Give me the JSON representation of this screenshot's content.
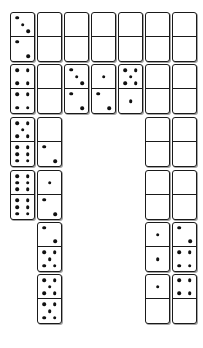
{
  "scene": {
    "title": "Domino Board",
    "background_color": "#ffffff",
    "tile_color": "#ffffff",
    "tile_border_color": "#1a1a1a",
    "pip_color": "#111111",
    "grid": {
      "columns": 7,
      "rows": 6
    },
    "tile_size": {
      "width": 25,
      "height": 50
    },
    "layout_shape": "u-shape"
  },
  "dominoes": [
    {
      "id": "d-r1c1",
      "col": 1,
      "row": 1,
      "x": 10,
      "y": 12,
      "top": 3,
      "bottom": 2,
      "top_pattern": "three-diagonal",
      "bottom_pattern": "two-diagonal"
    },
    {
      "id": "d-r1c2",
      "col": 2,
      "row": 1,
      "x": 37,
      "y": 12,
      "top": 0,
      "bottom": 0,
      "top_pattern": "blank",
      "bottom_pattern": "blank"
    },
    {
      "id": "d-r1c3",
      "col": 3,
      "row": 1,
      "x": 64,
      "y": 12,
      "top": 0,
      "bottom": 0,
      "top_pattern": "blank",
      "bottom_pattern": "blank"
    },
    {
      "id": "d-r1c4",
      "col": 4,
      "row": 1,
      "x": 91,
      "y": 12,
      "top": 0,
      "bottom": 0,
      "top_pattern": "blank",
      "bottom_pattern": "blank"
    },
    {
      "id": "d-r1c5",
      "col": 5,
      "row": 1,
      "x": 118,
      "y": 12,
      "top": 0,
      "bottom": 0,
      "top_pattern": "blank",
      "bottom_pattern": "blank"
    },
    {
      "id": "d-r1c6",
      "col": 6,
      "row": 1,
      "x": 145,
      "y": 12,
      "top": 0,
      "bottom": 0,
      "top_pattern": "blank",
      "bottom_pattern": "blank"
    },
    {
      "id": "d-r1c7",
      "col": 7,
      "row": 1,
      "x": 172,
      "y": 12,
      "top": 0,
      "bottom": 0,
      "top_pattern": "blank",
      "bottom_pattern": "blank"
    },
    {
      "id": "d-r2c1",
      "col": 1,
      "row": 2,
      "x": 10,
      "y": 64,
      "top": 4,
      "bottom": 4,
      "top_pattern": "four-corners",
      "bottom_pattern": "four-corners"
    },
    {
      "id": "d-r2c2",
      "col": 2,
      "row": 2,
      "x": 37,
      "y": 64,
      "top": 0,
      "bottom": 0,
      "top_pattern": "blank",
      "bottom_pattern": "blank"
    },
    {
      "id": "d-r2c3",
      "col": 3,
      "row": 2,
      "x": 64,
      "y": 64,
      "top": 3,
      "bottom": 2,
      "top_pattern": "three-diagonal",
      "bottom_pattern": "two-diagonal"
    },
    {
      "id": "d-r2c4",
      "col": 4,
      "row": 2,
      "x": 91,
      "y": 64,
      "top": 1,
      "bottom": 2,
      "top_pattern": "one-center",
      "bottom_pattern": "two-diagonal"
    },
    {
      "id": "d-r2c5",
      "col": 5,
      "row": 2,
      "x": 118,
      "y": 64,
      "top": 5,
      "bottom": 1,
      "top_pattern": "five-quincunx",
      "bottom_pattern": "one-center"
    },
    {
      "id": "d-r2c6",
      "col": 6,
      "row": 2,
      "x": 145,
      "y": 64,
      "top": 0,
      "bottom": 0,
      "top_pattern": "blank",
      "bottom_pattern": "blank"
    },
    {
      "id": "d-r2c7",
      "col": 7,
      "row": 2,
      "x": 172,
      "y": 64,
      "top": 0,
      "bottom": 0,
      "top_pattern": "blank",
      "bottom_pattern": "blank"
    },
    {
      "id": "d-r3c1",
      "col": 1,
      "row": 3,
      "x": 10,
      "y": 117,
      "top": 5,
      "bottom": 6,
      "top_pattern": "five-quincunx",
      "bottom_pattern": "six-two-columns"
    },
    {
      "id": "d-r3c2",
      "col": 2,
      "row": 3,
      "x": 37,
      "y": 117,
      "top": 0,
      "bottom": 2,
      "top_pattern": "blank",
      "bottom_pattern": "two-diagonal"
    },
    {
      "id": "d-r3c6",
      "col": 6,
      "row": 3,
      "x": 145,
      "y": 117,
      "top": 0,
      "bottom": 0,
      "top_pattern": "blank",
      "bottom_pattern": "blank"
    },
    {
      "id": "d-r3c7",
      "col": 7,
      "row": 3,
      "x": 172,
      "y": 117,
      "top": 0,
      "bottom": 0,
      "top_pattern": "blank",
      "bottom_pattern": "blank"
    },
    {
      "id": "d-r4c1",
      "col": 1,
      "row": 4,
      "x": 10,
      "y": 170,
      "top": 6,
      "bottom": 6,
      "top_pattern": "six-two-columns",
      "bottom_pattern": "six-two-columns"
    },
    {
      "id": "d-r4c2",
      "col": 2,
      "row": 4,
      "x": 37,
      "y": 170,
      "top": 1,
      "bottom": 2,
      "top_pattern": "one-center",
      "bottom_pattern": "two-diagonal"
    },
    {
      "id": "d-r4c6",
      "col": 6,
      "row": 4,
      "x": 145,
      "y": 170,
      "top": 0,
      "bottom": 0,
      "top_pattern": "blank",
      "bottom_pattern": "blank"
    },
    {
      "id": "d-r4c7",
      "col": 7,
      "row": 4,
      "x": 172,
      "y": 170,
      "top": 0,
      "bottom": 0,
      "top_pattern": "blank",
      "bottom_pattern": "blank"
    },
    {
      "id": "d-r5c2",
      "col": 2,
      "row": 5,
      "x": 37,
      "y": 222,
      "top": 2,
      "bottom": 5,
      "top_pattern": "two-diagonal",
      "bottom_pattern": "five-quincunx"
    },
    {
      "id": "d-r5c6",
      "col": 6,
      "row": 5,
      "x": 145,
      "y": 222,
      "top": 1,
      "bottom": 1,
      "top_pattern": "one-center",
      "bottom_pattern": "one-center"
    },
    {
      "id": "d-r5c7",
      "col": 7,
      "row": 5,
      "x": 172,
      "y": 222,
      "top": 2,
      "bottom": 4,
      "top_pattern": "two-diagonal",
      "bottom_pattern": "four-corners"
    },
    {
      "id": "d-r6c2",
      "col": 2,
      "row": 6,
      "x": 37,
      "y": 274,
      "top": 5,
      "bottom": 5,
      "top_pattern": "five-quincunx",
      "bottom_pattern": "five-quincunx"
    },
    {
      "id": "d-r6c6",
      "col": 6,
      "row": 6,
      "x": 145,
      "y": 274,
      "top": 1,
      "bottom": 0,
      "top_pattern": "one-center",
      "bottom_pattern": "blank"
    },
    {
      "id": "d-r6c7",
      "col": 7,
      "row": 6,
      "x": 172,
      "y": 274,
      "top": 4,
      "bottom": 0,
      "top_pattern": "four-corners",
      "bottom_pattern": "blank"
    }
  ]
}
